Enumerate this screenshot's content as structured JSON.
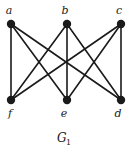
{
  "figure": {
    "caption_base": "G",
    "caption_subscript": "1",
    "background_color": "#ffffff",
    "ink_color": "#1a1a1a",
    "edge_color": "#1a1a1a"
  },
  "chart_data": {
    "type": "diagram",
    "diagram_kind": "graph",
    "vertex_count": 6,
    "edge_count": 9,
    "vertices": [
      {
        "id": "a",
        "label": "a",
        "x": 11,
        "y": 24,
        "label_x": 9,
        "label_y": 14,
        "row": "top"
      },
      {
        "id": "b",
        "label": "b",
        "x": 67,
        "y": 24,
        "label_x": 65,
        "label_y": 14,
        "row": "top"
      },
      {
        "id": "c",
        "label": "c",
        "x": 121,
        "y": 24,
        "label_x": 119,
        "label_y": 14,
        "row": "top"
      },
      {
        "id": "f",
        "label": "f",
        "x": 11,
        "y": 100,
        "label_x": 10,
        "label_y": 117,
        "row": "bottom"
      },
      {
        "id": "e",
        "label": "e",
        "x": 67,
        "y": 100,
        "label_x": 64,
        "label_y": 117,
        "row": "bottom"
      },
      {
        "id": "d",
        "label": "d",
        "x": 121,
        "y": 100,
        "label_x": 118,
        "label_y": 117,
        "row": "bottom"
      }
    ],
    "edges": [
      {
        "from": "a",
        "to": "f",
        "x1": 11,
        "y1": 24,
        "x2": 11,
        "y2": 100
      },
      {
        "from": "a",
        "to": "e",
        "x1": 11,
        "y1": 24,
        "x2": 67,
        "y2": 100
      },
      {
        "from": "a",
        "to": "d",
        "x1": 11,
        "y1": 24,
        "x2": 121,
        "y2": 100
      },
      {
        "from": "b",
        "to": "f",
        "x1": 67,
        "y1": 24,
        "x2": 11,
        "y2": 100
      },
      {
        "from": "b",
        "to": "e",
        "x1": 67,
        "y1": 24,
        "x2": 67,
        "y2": 100
      },
      {
        "from": "b",
        "to": "d",
        "x1": 67,
        "y1": 24,
        "x2": 121,
        "y2": 100
      },
      {
        "from": "c",
        "to": "f",
        "x1": 121,
        "y1": 24,
        "x2": 11,
        "y2": 100
      },
      {
        "from": "c",
        "to": "e",
        "x1": 121,
        "y1": 24,
        "x2": 67,
        "y2": 100
      },
      {
        "from": "c",
        "to": "d",
        "x1": 121,
        "y1": 24,
        "x2": 121,
        "y2": 100
      }
    ],
    "partite_sets": {
      "top": [
        "a",
        "b",
        "c"
      ],
      "bottom": [
        "f",
        "e",
        "d"
      ]
    },
    "vertex_radius": 4.2,
    "edge_width": 1.6
  }
}
